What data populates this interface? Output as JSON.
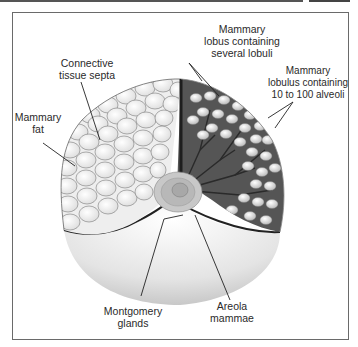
{
  "figure": {
    "type": "anatomical-diagram",
    "labels": [
      {
        "id": "mammary-lobus",
        "text": "Mammary\nlobus containing\nseveral lobuli"
      },
      {
        "id": "connective-tissue-septa",
        "text": "Connective\ntissue septa"
      },
      {
        "id": "mammary-lobulus",
        "text": "Mammary\nlobulus containing\n10 to 100 alveoli"
      },
      {
        "id": "mammary-fat",
        "text": "Mammary\nfat"
      },
      {
        "id": "montgomery-glands",
        "text": "Montgomery\nglands"
      },
      {
        "id": "areola-mammae",
        "text": "Areola\nmammae"
      }
    ]
  },
  "colors": {
    "frame": "#6a6a6a",
    "text": "#2a2a2a",
    "fat_lobules": "#f2f2f2",
    "gland_dark": "#3a3a3a",
    "alveoli": "#e8e8e8",
    "skin_shading": "#d8d8d8"
  }
}
